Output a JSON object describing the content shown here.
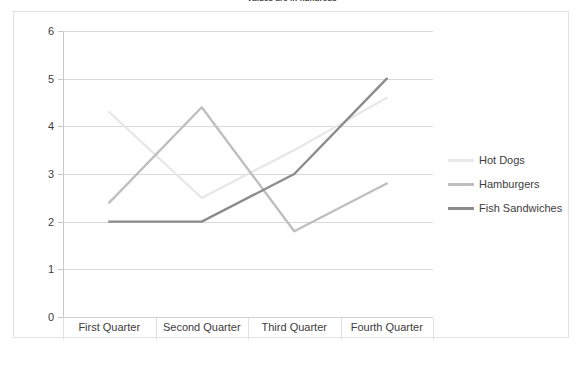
{
  "chart_data": {
    "type": "line",
    "title": "Values are in hundreds",
    "xlabel": "",
    "ylabel": "",
    "categories": [
      "First Quarter",
      "Second Quarter",
      "Third Quarter",
      "Fourth Quarter"
    ],
    "ylim": [
      0,
      6
    ],
    "yticks": [
      0,
      1,
      2,
      3,
      4,
      5,
      6
    ],
    "grid": true,
    "legend_position": "right",
    "series": [
      {
        "name": "Hot Dogs",
        "values": [
          4.3,
          2.5,
          3.5,
          4.6
        ],
        "color": "#e8e8e8"
      },
      {
        "name": "Hamburgers",
        "values": [
          2.4,
          4.4,
          1.8,
          2.8
        ],
        "color": "#bfbfbf"
      },
      {
        "name": "Fish Sandwiches",
        "values": [
          2.0,
          2.0,
          3.0,
          5.0
        ],
        "color": "#8c8c8c"
      }
    ]
  },
  "axis": {
    "y_labels": [
      "6",
      "5",
      "4",
      "3",
      "2",
      "1",
      "0"
    ]
  },
  "legend": {
    "items": [
      {
        "label": "Hot Dogs"
      },
      {
        "label": "Hamburgers"
      },
      {
        "label": "Fish Sandwiches"
      }
    ]
  }
}
